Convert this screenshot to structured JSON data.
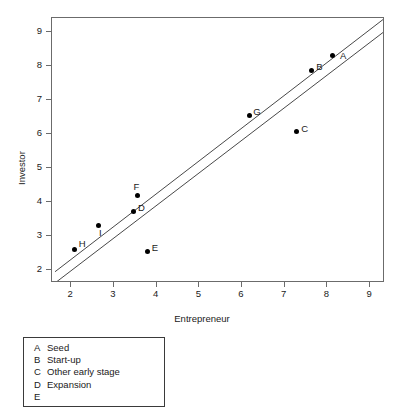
{
  "chart_data": {
    "type": "scatter",
    "title": "",
    "xlabel": "Entrepreneur",
    "ylabel": "Investor",
    "xlim": [
      1.55,
      9.35
    ],
    "ylim": [
      1.62,
      9.4
    ],
    "xticks": [
      "2",
      "3",
      "4",
      "5",
      "6",
      "7",
      "8",
      "9"
    ],
    "xtick_values": [
      2,
      3,
      4,
      5,
      6,
      7,
      8,
      9
    ],
    "yticks": [
      "2",
      "3",
      "4",
      "5",
      "6",
      "7",
      "8",
      "9"
    ],
    "ytick_values": [
      2,
      3,
      4,
      5,
      6,
      7,
      8,
      9
    ],
    "grid": false,
    "legend_position": "below-plot-left",
    "points": [
      {
        "key": "A",
        "x": 8.13,
        "y": 8.31,
        "label_dx": 7,
        "label_dy": -4
      },
      {
        "key": "B",
        "x": 7.62,
        "y": 7.85,
        "label_dx": 5,
        "label_dy": -9
      },
      {
        "key": "C",
        "x": 7.27,
        "y": 6.06,
        "label_dx": 5,
        "label_dy": -8
      },
      {
        "key": "D",
        "x": 3.47,
        "y": 3.72,
        "label_dx": 4,
        "label_dy": -8
      },
      {
        "key": "E",
        "x": 3.79,
        "y": 2.54,
        "label_dx": 4,
        "label_dy": -9
      },
      {
        "key": "F",
        "x": 3.55,
        "y": 4.2,
        "label_dx": -4,
        "label_dy": -13
      },
      {
        "key": "G",
        "x": 6.17,
        "y": 6.53,
        "label_dx": 4,
        "label_dy": -9
      },
      {
        "key": "H",
        "x": 2.08,
        "y": 2.61,
        "label_dx": 4,
        "label_dy": -10
      },
      {
        "key": "I",
        "x": 2.63,
        "y": 3.3,
        "label_dx": 1,
        "label_dy": 2
      }
    ],
    "lines": [
      {
        "name": "line-upper",
        "x0": 1.62,
        "y0": 1.95,
        "x1": 9.35,
        "y1": 9.4
      },
      {
        "name": "line-lower",
        "x0": 1.62,
        "y0": 1.62,
        "x1": 9.35,
        "y1": 9.02
      }
    ]
  },
  "legend": {
    "entries": [
      {
        "key": "A",
        "label": "Seed"
      },
      {
        "key": "B",
        "label": "Start-up"
      },
      {
        "key": "C",
        "label": "Other early stage"
      },
      {
        "key": "D",
        "label": "Expansion"
      },
      {
        "key": "E",
        "label": ""
      }
    ]
  }
}
